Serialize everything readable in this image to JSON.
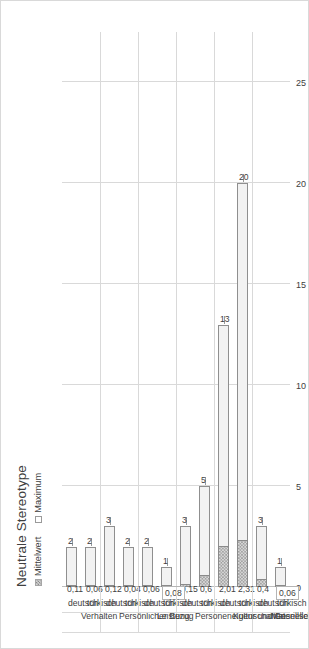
{
  "figure": {
    "title": "Neutrale Stereotype",
    "legend": [
      {
        "label": "Mittelwert",
        "swatch": "hatched-gray"
      },
      {
        "label": "Maximum",
        "swatch": "white-outline"
      }
    ]
  },
  "chart_data": {
    "type": "bar",
    "orientation": "horizontal",
    "title": "Neutrale Stereotype",
    "xlabel": "",
    "ylabel": "",
    "xlim": [
      0,
      27.5
    ],
    "ticks": [
      "0",
      "5",
      "10",
      "15",
      "20",
      "25"
    ],
    "tick_values": [
      0,
      5,
      10,
      15,
      20,
      25
    ],
    "grid": true,
    "legend_position": "top-left",
    "groups": [
      "Materielles",
      "Kultur und Gesellschaft",
      "Personeneigenschaften",
      "Leistung",
      "Persönlicher Bezug",
      "Verhalten"
    ],
    "subcategories": [
      "türkisch",
      "deutsch"
    ],
    "series": [
      {
        "name": "Mittelwert",
        "values": [
          0.06,
          0.4,
          2.31,
          2.01,
          0.6,
          0.15,
          0.08,
          0.06,
          0.04,
          0.12,
          0.06,
          0.11
        ],
        "labels": [
          "0,06",
          "0,4",
          "2,31",
          "2,01",
          "0,6",
          "0,15",
          "0,08",
          "0,06",
          "0,04",
          "0,12",
          "0,06",
          "0,11"
        ]
      },
      {
        "name": "Maximum",
        "values": [
          1,
          3,
          20,
          13,
          5,
          3,
          1,
          2,
          2,
          3,
          2,
          2
        ],
        "labels": [
          "1",
          "3",
          "20",
          "13",
          "5",
          "3",
          "1",
          "2",
          "2",
          "3",
          "2",
          "2"
        ]
      }
    ],
    "bars": [
      {
        "group": "Materielles",
        "lang": "türkisch",
        "mittelwert": 0.06,
        "mittelwert_label": "0,06",
        "maximum": 1,
        "maximum_label": "1"
      },
      {
        "group": "Materielles",
        "lang": "deutsch",
        "mittelwert": 0.4,
        "mittelwert_label": "0,4",
        "maximum": 3,
        "maximum_label": "3"
      },
      {
        "group": "Kultur und Gesellschaft",
        "lang": "türkisch",
        "mittelwert": 2.31,
        "mittelwert_label": "2,31",
        "maximum": 20,
        "maximum_label": "20"
      },
      {
        "group": "Kultur und Gesellschaft",
        "lang": "deutsch",
        "mittelwert": 2.01,
        "mittelwert_label": "2,01",
        "maximum": 13,
        "maximum_label": "13"
      },
      {
        "group": "Personeneigenschaften",
        "lang": "türkisch",
        "mittelwert": 0.6,
        "mittelwert_label": "0,6",
        "maximum": 5,
        "maximum_label": "5"
      },
      {
        "group": "Personeneigenschaften",
        "lang": "deutsch",
        "mittelwert": 0.15,
        "mittelwert_label": "0,15",
        "maximum": 3,
        "maximum_label": "3"
      },
      {
        "group": "Leistung",
        "lang": "türkisch",
        "mittelwert": 0.08,
        "mittelwert_label": "0,08",
        "maximum": 1,
        "maximum_label": "1"
      },
      {
        "group": "Leistung",
        "lang": "deutsch",
        "mittelwert": 0.06,
        "mittelwert_label": "0,06",
        "maximum": 2,
        "maximum_label": "2"
      },
      {
        "group": "Persönlicher Bezug",
        "lang": "türkisch",
        "mittelwert": 0.04,
        "mittelwert_label": "0,04",
        "maximum": 2,
        "maximum_label": "2"
      },
      {
        "group": "Persönlicher Bezug",
        "lang": "deutsch",
        "mittelwert": 0.12,
        "mittelwert_label": "0,12",
        "maximum": 3,
        "maximum_label": "3"
      },
      {
        "group": "Verhalten",
        "lang": "türkisch",
        "mittelwert": 0.06,
        "mittelwert_label": "0,06",
        "maximum": 2,
        "maximum_label": "2"
      },
      {
        "group": "Verhalten",
        "lang": "deutsch",
        "mittelwert": 0.11,
        "mittelwert_label": "0,11",
        "maximum": 2,
        "maximum_label": "2"
      }
    ]
  },
  "colors": {
    "grid": "#d9d9d9",
    "axis": "#bfbfbf",
    "text": "#404040",
    "mittelwert_fill": "#d9d9d9",
    "maximum_fill": "#f2f2f2",
    "bar_border": "#8f8f8f"
  }
}
